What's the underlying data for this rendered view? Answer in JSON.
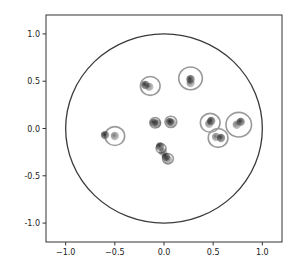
{
  "chart_data": {
    "type": "scatter",
    "title": "",
    "xlabel": "",
    "ylabel": "",
    "xlim": [
      -1.2,
      1.2
    ],
    "ylim": [
      -1.2,
      1.2
    ],
    "grid": false,
    "legend": null,
    "xticks": [
      -1.0,
      -0.5,
      0.0,
      0.5,
      1.0
    ],
    "yticks": [
      -1.0,
      -0.5,
      0.0,
      0.5,
      1.0
    ],
    "xtick_labels": [
      "−1.0",
      "−0.5",
      "0.0",
      "0.5",
      "1.0"
    ],
    "ytick_labels": [
      "-1.0",
      "-0.5",
      "0.0",
      "0.5",
      "1.0"
    ],
    "unit_circle": {
      "cx": 0.0,
      "cy": 0.0,
      "r": 1.0,
      "color": "#3a3a3a"
    },
    "series": [
      {
        "name": "points",
        "color": "#2a2a2a",
        "points": [
          {
            "x": -0.19,
            "y": 0.46
          },
          {
            "x": -0.15,
            "y": 0.44
          },
          {
            "x": 0.27,
            "y": 0.52
          },
          {
            "x": 0.27,
            "y": 0.48
          },
          {
            "x": -0.1,
            "y": 0.06
          },
          {
            "x": -0.07,
            "y": 0.05
          },
          {
            "x": 0.06,
            "y": 0.07
          },
          {
            "x": 0.08,
            "y": 0.06
          },
          {
            "x": 0.48,
            "y": 0.08
          },
          {
            "x": 0.46,
            "y": 0.05
          },
          {
            "x": 0.78,
            "y": 0.07
          },
          {
            "x": 0.74,
            "y": 0.04
          },
          {
            "x": 0.58,
            "y": -0.1
          },
          {
            "x": 0.53,
            "y": -0.09
          },
          {
            "x": -0.6,
            "y": -0.07
          },
          {
            "x": -0.5,
            "y": -0.08
          },
          {
            "x": -0.04,
            "y": -0.19
          },
          {
            "x": -0.01,
            "y": -0.25
          },
          {
            "x": 0.02,
            "y": -0.3
          },
          {
            "x": 0.04,
            "y": -0.33
          }
        ]
      },
      {
        "name": "rings",
        "color": "#9a9a9a",
        "circles": [
          {
            "x": -0.14,
            "y": 0.45,
            "r": 0.1
          },
          {
            "x": 0.27,
            "y": 0.53,
            "r": 0.12
          },
          {
            "x": -0.09,
            "y": 0.06,
            "r": 0.055
          },
          {
            "x": 0.07,
            "y": 0.07,
            "r": 0.06
          },
          {
            "x": 0.47,
            "y": 0.06,
            "r": 0.1
          },
          {
            "x": 0.76,
            "y": 0.04,
            "r": 0.13
          },
          {
            "x": 0.55,
            "y": -0.1,
            "r": 0.1
          },
          {
            "x": -0.5,
            "y": -0.08,
            "r": 0.1
          },
          {
            "x": -0.03,
            "y": -0.21,
            "r": 0.05
          },
          {
            "x": 0.04,
            "y": -0.32,
            "r": 0.055
          }
        ]
      }
    ]
  }
}
